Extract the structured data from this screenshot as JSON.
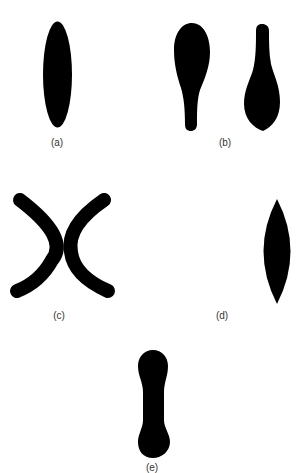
{
  "figure": {
    "fill_color": "#000000",
    "background": "#ffffff",
    "panels": [
      {
        "id": "a",
        "label": "(a)",
        "shape": "elongated ellipse"
      },
      {
        "id": "b",
        "label": "(b)",
        "shape": "two club/spoon shapes (one wide at top, one wide at bottom)"
      },
      {
        "id": "c",
        "label": "(c)",
        "shape": "two facing crescent arcs"
      },
      {
        "id": "d",
        "label": "(d)",
        "shape": "pointed lens / vesica"
      },
      {
        "id": "e",
        "label": "(e)",
        "shape": "dumbbell / peanut"
      }
    ]
  }
}
